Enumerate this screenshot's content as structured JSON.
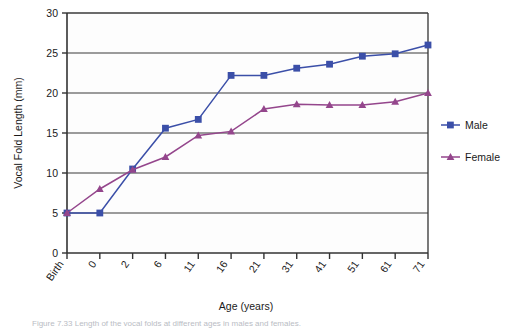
{
  "chart_data": {
    "type": "line",
    "title": "",
    "xlabel": "Age (years)",
    "ylabel": "Vocal Fold Length (mm)",
    "categories": [
      "Birth",
      "0",
      "2",
      "6",
      "11",
      "16",
      "21",
      "31",
      "41",
      "51",
      "61",
      "71"
    ],
    "ylim": [
      0,
      30
    ],
    "yticks": [
      0,
      5,
      10,
      15,
      20,
      25,
      30
    ],
    "ytick_labels": [
      "0",
      "5",
      "10",
      "15",
      "20",
      "25",
      "30"
    ],
    "grid": "horizontal",
    "legend_position": "right",
    "series": [
      {
        "name": "Male",
        "color": "#3B4FA8",
        "marker": "square",
        "values": [
          5.0,
          5.0,
          10.5,
          15.6,
          16.7,
          22.2,
          22.2,
          23.1,
          23.6,
          24.6,
          24.9,
          26.0
        ]
      },
      {
        "name": "Female",
        "color": "#94468C",
        "marker": "triangle",
        "values": [
          5.0,
          8.0,
          10.4,
          12.0,
          14.7,
          15.2,
          18.0,
          18.6,
          18.5,
          18.5,
          18.9,
          20.0
        ]
      }
    ]
  },
  "axes": {
    "y_title": "Vocal Fold Length (mm)",
    "x_title": "Age (years)"
  },
  "legend": {
    "entries": [
      {
        "label": "Male"
      },
      {
        "label": "Female"
      }
    ]
  },
  "caption": {
    "text": "Figure 7.33  Length of the vocal folds at different ages in males and females."
  }
}
